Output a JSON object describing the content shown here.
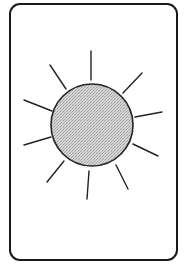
{
  "card": {
    "shape": "rounded-rectangle",
    "border_color": "#1a1a1a",
    "background": "#ffffff"
  },
  "sun": {
    "icon": "sun-icon",
    "center": [
      92,
      125
    ],
    "radius": 41,
    "fill": "#c9c9c9",
    "stroke": "#222222",
    "rays": [
      {
        "x1": 91,
        "y1": 51,
        "x2": 91,
        "y2": 80
      },
      {
        "x1": 50,
        "y1": 65,
        "x2": 66,
        "y2": 89
      },
      {
        "x1": 142,
        "y1": 73,
        "x2": 123,
        "y2": 93
      },
      {
        "x1": 24,
        "y1": 100,
        "x2": 52,
        "y2": 111
      },
      {
        "x1": 135,
        "y1": 117,
        "x2": 162,
        "y2": 112
      },
      {
        "x1": 24,
        "y1": 145,
        "x2": 51,
        "y2": 137
      },
      {
        "x1": 133,
        "y1": 144,
        "x2": 158,
        "y2": 156
      },
      {
        "x1": 47,
        "y1": 182,
        "x2": 64,
        "y2": 161
      },
      {
        "x1": 89,
        "y1": 171,
        "x2": 87,
        "y2": 199
      },
      {
        "x1": 116,
        "y1": 165,
        "x2": 128,
        "y2": 189
      }
    ]
  }
}
